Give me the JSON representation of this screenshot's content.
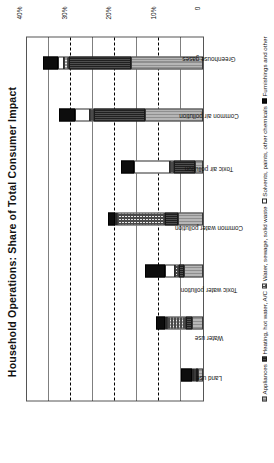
{
  "chart_data": {
    "type": "bar",
    "subtype": "stacked-bar",
    "title": "Household Operations: Share of Total Consumer Impact",
    "xlabel": "",
    "ylabel": "",
    "orientation": "vertical",
    "grid": true,
    "legend_position": "bottom",
    "ylim": [
      0,
      40
    ],
    "yticks": [
      0,
      10,
      20,
      30,
      40
    ],
    "ytick_labels": [
      "0",
      "10%",
      "20%",
      "30%",
      "40%"
    ],
    "gridline_values": [
      5,
      10,
      15,
      20,
      25,
      30,
      35
    ],
    "categories": [
      "Land use",
      "Water use",
      "Toxic water pollution",
      "Common water pollution",
      "Toxic air pollution",
      "Common air pollution",
      "Greenhouse gases"
    ],
    "series": [
      {
        "name": "Appliances",
        "pattern": "horizontal-lines-gray",
        "color": "#b6b6b6",
        "values": [
          1.2,
          2.6,
          4.3,
          5.7,
          1.9,
          13.1,
          16.4
        ]
      },
      {
        "name": "Heating, hot water, A/C",
        "pattern": "solid-dark-gray",
        "color": "#3a3a3a",
        "values": [
          0.5,
          1.4,
          1.1,
          3.0,
          4.7,
          11.6,
          14.0
        ]
      },
      {
        "name": "Water, sewage, solid waste",
        "pattern": "checkerboard",
        "color": "#e8e8e8",
        "values": [
          0.4,
          4.4,
          0.9,
          10.8,
          0.9,
          1.1,
          1.3
        ]
      },
      {
        "name": "Solvents, paints, other chemicals",
        "pattern": "white",
        "color": "#ffffff",
        "values": [
          0.4,
          0.3,
          2.3,
          0.5,
          8.1,
          3.4,
          1.2
        ]
      },
      {
        "name": "Furnishings and other",
        "pattern": "solid-black",
        "color": "#0d0d0d",
        "values": [
          2.4,
          1.9,
          4.6,
          1.7,
          3.1,
          3.6,
          3.5
        ]
      }
    ],
    "totals": [
      4.9,
      10.6,
      13.2,
      21.7,
      18.7,
      32.8,
      36.4
    ]
  }
}
